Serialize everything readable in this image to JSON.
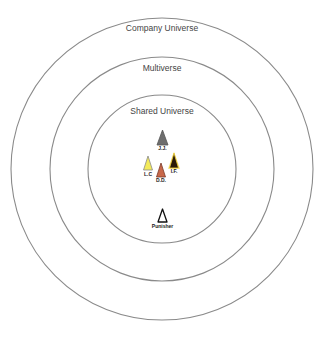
{
  "diagram": {
    "type": "concentric-circles",
    "center": [
      162,
      169
    ],
    "rings": [
      {
        "label": "Company Universe",
        "radius": 151,
        "label_y": 31
      },
      {
        "label": "Multiverse",
        "radius": 112,
        "label_y": 71
      },
      {
        "label": "Shared Universe",
        "radius": 74,
        "label_y": 114
      }
    ],
    "markers": [
      {
        "label": "J.J.",
        "x": 162.5,
        "y": 130,
        "w": 11,
        "h": 15,
        "fill": "#6e6e6e",
        "stroke": "#555555",
        "label_y": 150
      },
      {
        "label": "L.C",
        "x": 148,
        "y": 156,
        "w": 9,
        "h": 14,
        "fill": "#f3ea5a",
        "stroke": "#8a8a8a",
        "label_y": 176
      },
      {
        "label": "D.D.",
        "x": 161,
        "y": 163,
        "w": 9,
        "h": 14,
        "fill": "#c8684a",
        "stroke": "#7a3a2a",
        "label_y": 182
      },
      {
        "label": "I.F.",
        "x": 174,
        "y": 153,
        "w": 9,
        "h": 15,
        "fill": "#2a1a08",
        "stroke": "#f2d23a",
        "label_y": 173
      },
      {
        "label": "Punisher",
        "x": 162.5,
        "y": 209,
        "w": 9,
        "h": 13,
        "fill": "#ffffff",
        "stroke": "#111111",
        "label_y": 228
      }
    ]
  }
}
